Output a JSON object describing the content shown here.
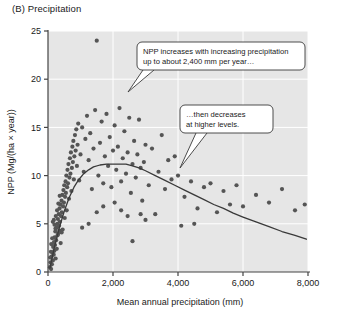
{
  "panel": {
    "label": "(B) Precipitation"
  },
  "chart_data": {
    "type": "scatter",
    "title": "(B) Precipitation",
    "xlabel": "Mean annual precipitation (mm)",
    "ylabel": "NPP (Mg/(ha × year))",
    "xlim": [
      0,
      8000
    ],
    "ylim": [
      0,
      25
    ],
    "xticks": [
      0,
      2000,
      4000,
      6000,
      8000
    ],
    "xticklabels": [
      "0",
      "2,000",
      "4,000",
      "6,000",
      "8,000"
    ],
    "yticks": [
      0,
      5,
      10,
      15,
      20,
      25
    ],
    "yticklabels": [
      "0",
      "5",
      "10",
      "15",
      "20",
      "25"
    ],
    "grid": true,
    "legend": "none",
    "point_color": "#555555",
    "curve_color": "#3a3a3a",
    "plot_background": "#e6e6e6",
    "gridline_color": "#ffffff",
    "points": [
      [
        60,
        0.5
      ],
      [
        80,
        1.0
      ],
      [
        95,
        0.3
      ],
      [
        110,
        1.6
      ],
      [
        120,
        0.8
      ],
      [
        140,
        2.0
      ],
      [
        150,
        1.2
      ],
      [
        160,
        2.6
      ],
      [
        175,
        1.8
      ],
      [
        185,
        3.1
      ],
      [
        195,
        2.2
      ],
      [
        205,
        3.6
      ],
      [
        215,
        2.8
      ],
      [
        225,
        4.2
      ],
      [
        235,
        1.4
      ],
      [
        250,
        3.3
      ],
      [
        260,
        4.6
      ],
      [
        270,
        2.4
      ],
      [
        285,
        5.0
      ],
      [
        295,
        3.8
      ],
      [
        305,
        5.5
      ],
      [
        315,
        4.0
      ],
      [
        330,
        6.0
      ],
      [
        340,
        4.8
      ],
      [
        355,
        6.6
      ],
      [
        365,
        5.2
      ],
      [
        380,
        7.0
      ],
      [
        390,
        3.0
      ],
      [
        400,
        5.8
      ],
      [
        415,
        7.4
      ],
      [
        425,
        6.2
      ],
      [
        440,
        8.0
      ],
      [
        450,
        4.4
      ],
      [
        465,
        6.8
      ],
      [
        475,
        8.5
      ],
      [
        490,
        7.2
      ],
      [
        500,
        9.0
      ],
      [
        515,
        5.6
      ],
      [
        525,
        7.8
      ],
      [
        540,
        9.4
      ],
      [
        550,
        8.2
      ],
      [
        565,
        10.0
      ],
      [
        575,
        6.4
      ],
      [
        590,
        8.8
      ],
      [
        600,
        10.6
      ],
      [
        615,
        9.2
      ],
      [
        630,
        11.2
      ],
      [
        645,
        7.6
      ],
      [
        660,
        9.8
      ],
      [
        675,
        11.8
      ],
      [
        690,
        10.2
      ],
      [
        705,
        12.4
      ],
      [
        720,
        8.4
      ],
      [
        735,
        10.8
      ],
      [
        750,
        13.0
      ],
      [
        765,
        11.4
      ],
      [
        780,
        13.6
      ],
      [
        795,
        9.6
      ],
      [
        810,
        12.0
      ],
      [
        830,
        14.2
      ],
      [
        850,
        12.6
      ],
      [
        870,
        14.8
      ],
      [
        890,
        11.0
      ],
      [
        910,
        13.2
      ],
      [
        930,
        15.4
      ],
      [
        200,
        4.9
      ],
      [
        230,
        4.5
      ],
      [
        310,
        4.7
      ],
      [
        350,
        4.3
      ],
      [
        420,
        4.1
      ],
      [
        150,
        5.2
      ],
      [
        180,
        5.4
      ],
      [
        130,
        3.5
      ],
      [
        100,
        2.9
      ],
      [
        90,
        2.1
      ],
      [
        70,
        1.5
      ],
      [
        240,
        5.8
      ],
      [
        280,
        6.4
      ],
      [
        320,
        7.1
      ],
      [
        360,
        7.9
      ],
      [
        960,
        9.5
      ],
      [
        1000,
        12.2
      ],
      [
        1050,
        15.0
      ],
      [
        1100,
        10.4
      ],
      [
        1150,
        13.8
      ],
      [
        1200,
        16.2
      ],
      [
        1250,
        11.6
      ],
      [
        1300,
        14.4
      ],
      [
        1350,
        8.6
      ],
      [
        1400,
        12.8
      ],
      [
        1450,
        16.8
      ],
      [
        1500,
        24.0
      ],
      [
        1550,
        10.0
      ],
      [
        1600,
        13.4
      ],
      [
        1650,
        15.6
      ],
      [
        1700,
        9.2
      ],
      [
        1750,
        12.0
      ],
      [
        1800,
        16.4
      ],
      [
        1850,
        11.0
      ],
      [
        1900,
        14.0
      ],
      [
        1950,
        8.8
      ],
      [
        2000,
        12.6
      ],
      [
        2050,
        15.2
      ],
      [
        2100,
        10.6
      ],
      [
        2150,
        13.0
      ],
      [
        2200,
        17.0
      ],
      [
        2250,
        9.4
      ],
      [
        2300,
        11.8
      ],
      [
        2350,
        14.6
      ],
      [
        2400,
        10.2
      ],
      [
        2450,
        12.4
      ],
      [
        2500,
        16.0
      ],
      [
        2550,
        8.2
      ],
      [
        2600,
        11.2
      ],
      [
        2650,
        13.6
      ],
      [
        2700,
        9.8
      ],
      [
        2750,
        12.2
      ],
      [
        2800,
        15.8
      ],
      [
        2850,
        10.8
      ],
      [
        2900,
        7.4
      ],
      [
        2950,
        11.4
      ],
      [
        3000,
        13.2
      ],
      [
        3100,
        9.0
      ],
      [
        3200,
        12.8
      ],
      [
        3300,
        6.0
      ],
      [
        3400,
        10.4
      ],
      [
        3500,
        14.2
      ],
      [
        3600,
        8.6
      ],
      [
        3700,
        11.6
      ],
      [
        3800,
        9.6
      ],
      [
        3900,
        12.0
      ],
      [
        4000,
        10.0
      ],
      [
        4200,
        7.8
      ],
      [
        4400,
        9.4
      ],
      [
        4600,
        6.6
      ],
      [
        4800,
        8.8
      ],
      [
        5000,
        9.2
      ],
      [
        5200,
        6.2
      ],
      [
        5400,
        8.4
      ],
      [
        5600,
        7.0
      ],
      [
        5800,
        9.0
      ],
      [
        6000,
        6.8
      ],
      [
        6400,
        8.0
      ],
      [
        6800,
        7.2
      ],
      [
        7200,
        8.6
      ],
      [
        7600,
        6.4
      ],
      [
        7900,
        7.0
      ],
      [
        2600,
        3.2
      ],
      [
        3000,
        5.4
      ],
      [
        4100,
        4.8
      ],
      [
        4500,
        5.0
      ],
      [
        1050,
        4.6
      ],
      [
        1250,
        5.0
      ],
      [
        1500,
        6.2
      ],
      [
        1700,
        6.8
      ],
      [
        2050,
        7.2
      ],
      [
        2250,
        6.4
      ],
      [
        2450,
        5.8
      ],
      [
        2850,
        6.0
      ]
    ],
    "fit_curve": {
      "description": "Hump-shaped fitted trend: NPP rises steeply to a peak near 2,400 mm then declines gradually.",
      "peak_x": 2400,
      "peak_y": 11.2,
      "points": [
        [
          60,
          0.4
        ],
        [
          200,
          2.6
        ],
        [
          350,
          4.6
        ],
        [
          500,
          6.3
        ],
        [
          650,
          7.7
        ],
        [
          800,
          8.8
        ],
        [
          950,
          9.6
        ],
        [
          1100,
          10.2
        ],
        [
          1250,
          10.6
        ],
        [
          1400,
          10.9
        ],
        [
          1600,
          11.1
        ],
        [
          1800,
          11.2
        ],
        [
          2000,
          11.2
        ],
        [
          2200,
          11.2
        ],
        [
          2400,
          11.2
        ],
        [
          2600,
          11.0
        ],
        [
          2800,
          10.8
        ],
        [
          3000,
          10.5
        ],
        [
          3300,
          10.0
        ],
        [
          3600,
          9.5
        ],
        [
          3900,
          9.0
        ],
        [
          4200,
          8.5
        ],
        [
          4500,
          8.0
        ],
        [
          4800,
          7.5
        ],
        [
          5100,
          7.0
        ],
        [
          5400,
          6.6
        ],
        [
          5700,
          6.1
        ],
        [
          6000,
          5.7
        ],
        [
          6400,
          5.2
        ],
        [
          6800,
          4.7
        ],
        [
          7200,
          4.2
        ],
        [
          7600,
          3.8
        ],
        [
          7950,
          3.4
        ]
      ]
    },
    "annotations": [
      {
        "id": "callout-increase",
        "lines": [
          "NPP increases with increasing precipitation",
          "up to about 2,400 mm per year…"
        ],
        "points_to": [
          1500,
          13.5
        ]
      },
      {
        "id": "callout-decrease",
        "lines": [
          "…then decreases",
          "at higher levels."
        ],
        "points_to": [
          4300,
          8.4
        ]
      }
    ]
  }
}
